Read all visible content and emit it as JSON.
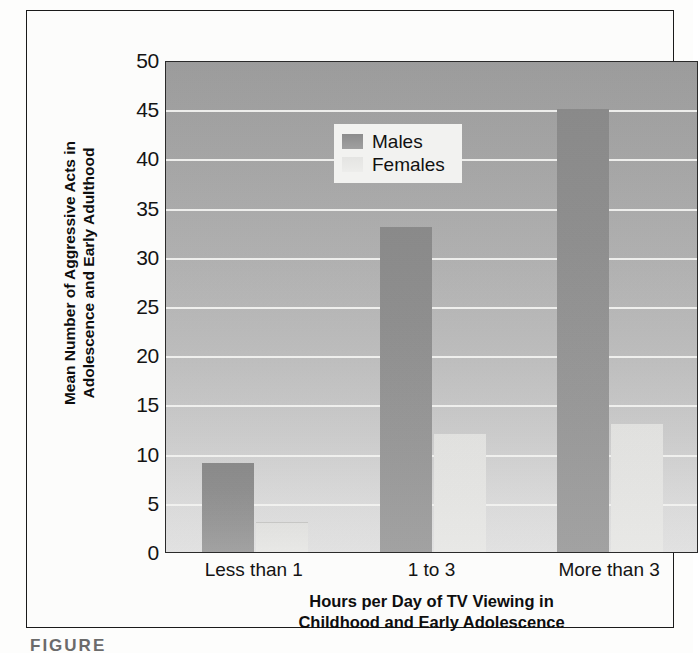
{
  "figure": {
    "caption_fragment": "FIGURE"
  },
  "chart_data": {
    "type": "bar",
    "title": "",
    "xlabel": "Hours per Day of TV Viewing in Childhood and Early Adolescence",
    "xlabel_line1": "Hours per Day of TV Viewing in",
    "xlabel_line2": "Childhood and Early Adolescence",
    "ylabel": "Mean Number of Aggressive Acts in Adolescence and Early Adulthood",
    "ylabel_line1": "Mean Number of Aggressive Acts in",
    "ylabel_line2": "Adolescence and Early Adulthood",
    "categories": [
      "Less than 1",
      "1 to 3",
      "More than 3"
    ],
    "series": [
      {
        "name": "Males",
        "values": [
          9,
          33,
          45
        ],
        "color": "#939393"
      },
      {
        "name": "Females",
        "values": [
          3,
          12,
          13
        ],
        "color": "#e7e7e5"
      }
    ],
    "ylim": [
      0,
      50
    ],
    "yticks": [
      0,
      5,
      10,
      15,
      20,
      25,
      30,
      35,
      40,
      45,
      50
    ],
    "grid": true,
    "legend_position": "top-left",
    "legend_entries": [
      "Males",
      "Females"
    ]
  }
}
